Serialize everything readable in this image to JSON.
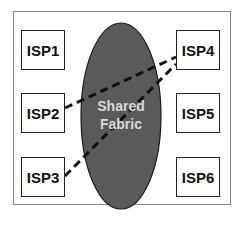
{
  "diagram": {
    "fabric": {
      "line1": "Shared",
      "line2": "Fabric",
      "fill": "#5a5a5a",
      "label_color": "#d8d8d8"
    },
    "nodes": [
      {
        "id": "isp1",
        "label": "ISP1"
      },
      {
        "id": "isp2",
        "label": "ISP2"
      },
      {
        "id": "isp3",
        "label": "ISP3"
      },
      {
        "id": "isp4",
        "label": "ISP4"
      },
      {
        "id": "isp5",
        "label": "ISP5"
      },
      {
        "id": "isp6",
        "label": "ISP6"
      }
    ],
    "connections": [
      {
        "from": "ISP2",
        "to": "ISP4",
        "style": "dashed"
      },
      {
        "from": "ISP3",
        "to": "ISP4",
        "style": "dashed"
      }
    ]
  }
}
